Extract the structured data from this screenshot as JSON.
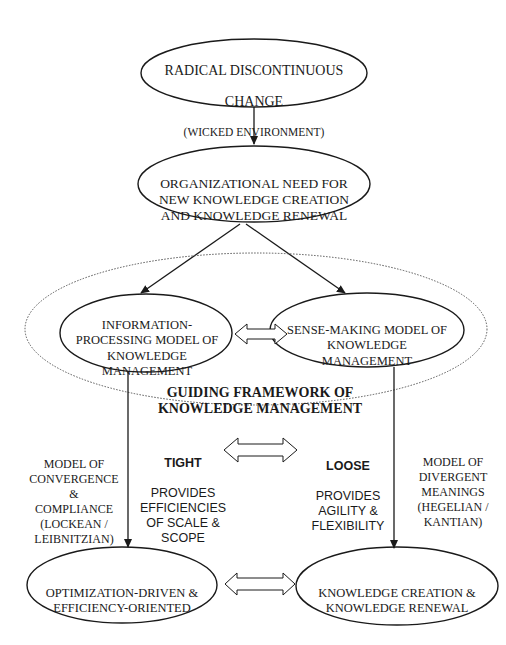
{
  "nodes": {
    "radical_change": {
      "line1": "RADICAL  DISCONTINUOUS",
      "line2": "CHANGE",
      "line3": "(WICKED ENVIRONMENT)"
    },
    "organizational_need": {
      "text": "ORGANIZATIONAL NEED FOR\nNEW KNOWLEDGE CREATION\nAND KNOWLEDGE RENEWAL"
    },
    "information_processing": {
      "text": "INFORMATION-\nPROCESSING MODEL OF\nKNOWLEDGE\nMANAGEMENT"
    },
    "sense_making": {
      "text": "SENSE-MAKING MODEL OF\nKNOWLEDGE\nMANAGEMENT"
    },
    "guiding_framework": {
      "text": "GUIDING FRAMEWORK OF\nKNOWLEDGE MANAGEMENT"
    },
    "optimization_driven": {
      "text": "OPTIMIZATION-DRIVEN &\nEFFICIENCY-ORIENTED"
    },
    "knowledge_creation": {
      "text": "KNOWLEDGE CREATION &\nKNOWLEDGE RENEWAL"
    }
  },
  "annotations": {
    "left_model": {
      "text": "MODEL OF\nCONVERGENCE &\nCOMPLIANCE\n(LOCKEAN /\nLEIBNITZIAN)"
    },
    "tight": {
      "heading": "TIGHT",
      "text": "PROVIDES\nEFFICIENCIES\nOF SCALE &\nSCOPE"
    },
    "loose": {
      "heading": "LOOSE",
      "text": "PROVIDES\nAGILITY &\nFLEXIBILITY"
    },
    "right_model": {
      "text": "MODEL OF\nDIVERGENT\nMEANINGS\n(HEGELIAN /\nKANTIAN)"
    }
  },
  "colors": {
    "stroke": "#1a1a1a",
    "background": "#ffffff",
    "dotted": "#555555"
  }
}
